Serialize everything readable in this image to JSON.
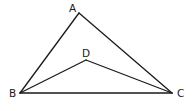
{
  "diagram": {
    "points": {
      "A": {
        "label": "A",
        "x": 79,
        "y": 13,
        "label_x": 71,
        "label_y": 11
      },
      "B": {
        "label": "B",
        "x": 20,
        "y": 93,
        "label_x": 9,
        "label_y": 97
      },
      "C": {
        "label": "C",
        "x": 172,
        "y": 93,
        "label_x": 177,
        "label_y": 97
      },
      "D": {
        "label": "D",
        "x": 86,
        "y": 60,
        "label_x": 82,
        "label_y": 56
      }
    },
    "segments": [
      {
        "from": "A",
        "to": "B"
      },
      {
        "from": "A",
        "to": "C"
      },
      {
        "from": "B",
        "to": "C"
      },
      {
        "from": "B",
        "to": "D"
      },
      {
        "from": "D",
        "to": "C"
      }
    ],
    "stroke_color": "#1a1a1a"
  }
}
